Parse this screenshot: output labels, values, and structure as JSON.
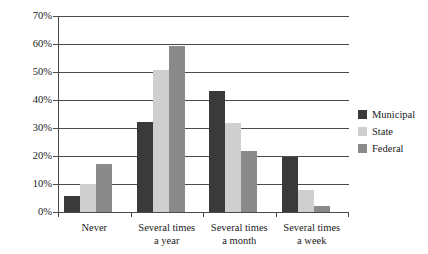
{
  "chart_data": {
    "type": "bar",
    "title": "",
    "xlabel": "",
    "ylabel": "",
    "categories": [
      "Never",
      "Several times a year",
      "Several times a month",
      "Several times a week"
    ],
    "category_lines": [
      [
        "Never",
        ""
      ],
      [
        "Several times",
        "a year"
      ],
      [
        "Several times",
        "a month"
      ],
      [
        "Several times",
        "a week"
      ]
    ],
    "series": [
      {
        "name": "Municipal",
        "color": "#3a3a3a",
        "values": [
          5.7,
          32.0,
          43.2,
          19.5
        ]
      },
      {
        "name": "State",
        "color": "#cfcfcf",
        "values": [
          10.0,
          50.6,
          31.7,
          7.8
        ]
      },
      {
        "name": "Federal",
        "color": "#8a8a8a",
        "values": [
          17.1,
          59.2,
          21.9,
          2.1
        ]
      }
    ],
    "ylim": [
      0,
      70
    ],
    "ytick_values": [
      0,
      10,
      20,
      30,
      40,
      50,
      60,
      70
    ],
    "ytick_labels": [
      "0%",
      "10%",
      "20%",
      "30%",
      "40%",
      "50%",
      "60%",
      "70%"
    ],
    "grid": true,
    "grid_axis": "y",
    "legend_position": "right",
    "value_suffix": "%"
  },
  "legend": {
    "entries": [
      {
        "label": "Municipal",
        "color": "#3a3a3a"
      },
      {
        "label": "State",
        "color": "#cfcfcf"
      },
      {
        "label": "Federal",
        "color": "#8a8a8a"
      }
    ]
  },
  "colors": {
    "municipal": "#3a3a3a",
    "state": "#cfcfcf",
    "federal": "#8a8a8a",
    "axis": "#4a4a4a",
    "text": "#1a1a1a",
    "background": "#ffffff"
  }
}
